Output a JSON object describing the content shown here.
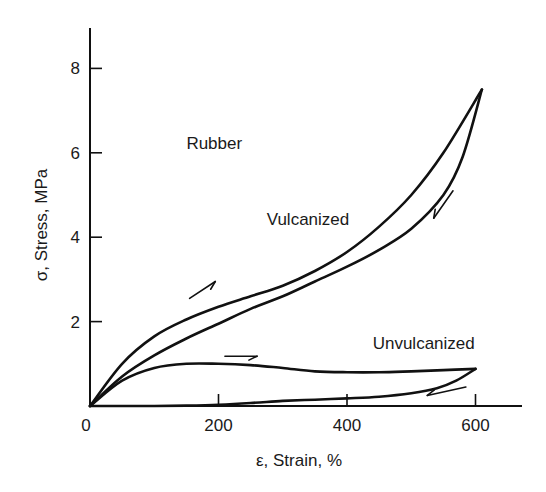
{
  "chart_data": {
    "type": "line",
    "title": "",
    "xlabel": "ε, Strain, %",
    "ylabel": "σ, Stress, MPa",
    "xlim": [
      0,
      700
    ],
    "ylim": [
      0,
      9
    ],
    "x_ticks": [
      0,
      200,
      400,
      600
    ],
    "y_ticks": [
      2,
      4,
      6,
      8
    ],
    "x_tick_labels": [
      "0",
      "200",
      "400",
      "600"
    ],
    "y_tick_labels": [
      "2",
      "4",
      "6",
      "8"
    ],
    "grid": false,
    "legend": null,
    "annotations": [
      {
        "text": "Rubber",
        "x": 150,
        "y": 6.1
      },
      {
        "text": "Vulcanized",
        "x": 275,
        "y": 4.3
      },
      {
        "text": "Unvulcanized",
        "x": 440,
        "y": 1.35
      }
    ],
    "series": [
      {
        "name": "Vulcanized (loading)",
        "direction": "increasing strain",
        "x": [
          0,
          50,
          100,
          150,
          200,
          250,
          300,
          350,
          400,
          450,
          500,
          550,
          610
        ],
        "y": [
          0,
          1.0,
          1.65,
          2.05,
          2.35,
          2.6,
          2.85,
          3.2,
          3.65,
          4.25,
          5.0,
          6.0,
          7.5
        ]
      },
      {
        "name": "Vulcanized (unloading)",
        "direction": "decreasing strain",
        "x": [
          610,
          580,
          550,
          500,
          450,
          400,
          350,
          300,
          250,
          200,
          150,
          100,
          50,
          0
        ],
        "y": [
          7.5,
          5.9,
          5.0,
          4.2,
          3.7,
          3.3,
          2.95,
          2.6,
          2.3,
          1.95,
          1.6,
          1.2,
          0.7,
          0
        ]
      },
      {
        "name": "Unvulcanized (loading)",
        "direction": "increasing strain",
        "x": [
          0,
          50,
          100,
          150,
          200,
          250,
          300,
          350,
          400,
          450,
          500,
          550,
          600
        ],
        "y": [
          0,
          0.6,
          0.9,
          1.0,
          1.0,
          0.97,
          0.9,
          0.82,
          0.8,
          0.8,
          0.82,
          0.85,
          0.88
        ]
      },
      {
        "name": "Unvulcanized (unloading)",
        "direction": "decreasing strain",
        "x": [
          600,
          570,
          540,
          500,
          450,
          400,
          350,
          300,
          250,
          200,
          150,
          100,
          50,
          0
        ],
        "y": [
          0.88,
          0.6,
          0.42,
          0.3,
          0.22,
          0.18,
          0.15,
          0.12,
          0.07,
          0.03,
          0.01,
          0.0,
          0.0,
          0
        ]
      }
    ]
  },
  "plot": {
    "origin_px": [
      90,
      406
    ],
    "px_per_x_unit": 0.6425,
    "px_per_y_unit": 42.2,
    "y_axis_top_px": 28,
    "x_axis_right_px": 522,
    "line_color": "#111111",
    "background": "#ffffff"
  },
  "arrows": [
    {
      "name": "vulcanized-loading-arrow",
      "from": [
        155,
        2.55
      ],
      "to": [
        195,
        2.95
      ]
    },
    {
      "name": "vulcanized-unloading-arrow",
      "from": [
        565,
        5.1
      ],
      "to": [
        535,
        4.45
      ]
    },
    {
      "name": "unvulcanized-loading-arrow",
      "from": [
        210,
        1.18
      ],
      "to": [
        260,
        1.18
      ]
    },
    {
      "name": "unvulcanized-unloading-arrow",
      "from": [
        585,
        0.45
      ],
      "to": [
        525,
        0.25
      ]
    }
  ]
}
